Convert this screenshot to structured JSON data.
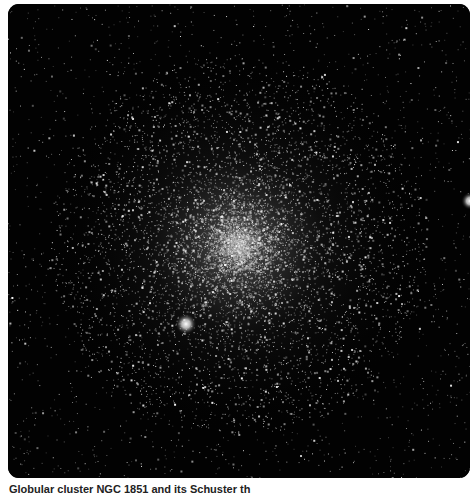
{
  "image": {
    "subject": "globular-cluster-starfield",
    "background_color": "#020202",
    "cluster_center": {
      "x": 230,
      "y": 241
    },
    "core_radius": 40,
    "halo_radius": 190,
    "bright_stars": [
      {
        "x": 178,
        "y": 320,
        "r": 6
      },
      {
        "x": 462,
        "y": 197,
        "r": 5
      }
    ]
  },
  "caption": {
    "text": "Globular cluster NGC 1851 and its Schuster th"
  }
}
